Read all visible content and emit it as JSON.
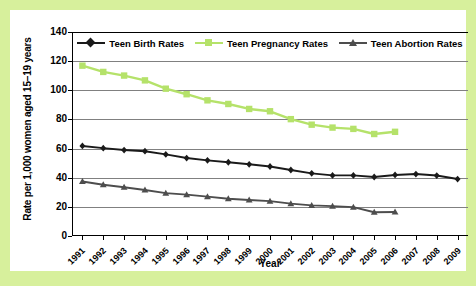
{
  "chart_data": {
    "type": "line",
    "title": "",
    "xlabel": "Year",
    "ylabel": "Rate per 1,000 women aged 15–19 years",
    "ylim": [
      0,
      140
    ],
    "ytick_values": [
      0,
      20,
      40,
      60,
      80,
      100,
      120,
      140
    ],
    "ytick_labels": [
      "0",
      "20",
      "40",
      "60",
      "80",
      "100",
      "120",
      "140"
    ],
    "grid": true,
    "legend_position": "top-inside",
    "categories": [
      "1991",
      "1992",
      "1993",
      "1994",
      "1995",
      "1996",
      "1997",
      "1998",
      "1999",
      "2000",
      "2001",
      "2002",
      "2003",
      "2004",
      "2005",
      "2006",
      "2007",
      "2008",
      "2009"
    ],
    "x": [
      1991,
      1992,
      1993,
      1994,
      1995,
      1996,
      1997,
      1998,
      1999,
      2000,
      2001,
      2002,
      2003,
      2004,
      2005,
      2006,
      2007,
      2008,
      2009
    ],
    "series": [
      {
        "name": "Teen Birth Rates",
        "color": "#1a1a1a",
        "marker": "diamond",
        "values": [
          61.8,
          60.3,
          59.0,
          58.2,
          56.0,
          53.5,
          51.9,
          50.6,
          49.2,
          47.7,
          45.3,
          43.0,
          41.6,
          41.6,
          40.5,
          41.9,
          42.5,
          41.5,
          39.1
        ]
      },
      {
        "name": "Teen Pregnancy Rates",
        "color": "#b5e26a",
        "marker": "square",
        "values": [
          116.9,
          112.6,
          110.1,
          106.8,
          101.1,
          97.3,
          93.1,
          90.6,
          87.2,
          85.6,
          80.2,
          76.4,
          74.4,
          73.5,
          70.0,
          71.5,
          null,
          null,
          null
        ]
      },
      {
        "name": "Teen Abortion Rates",
        "color": "#4d4d4d",
        "marker": "triangle",
        "values": [
          37.4,
          35.2,
          33.5,
          31.6,
          29.4,
          28.4,
          27.0,
          25.6,
          24.7,
          23.9,
          22.2,
          21.0,
          20.5,
          19.8,
          16.3,
          16.5,
          null,
          null,
          null
        ]
      }
    ]
  },
  "colors": {
    "background": "#d7f09c",
    "panel": "#ffffff",
    "grid": "#808080",
    "axis": "#000000",
    "birth": "#1a1a1a",
    "pregnancy": "#b5e26a",
    "abortion": "#4d4d4d"
  }
}
